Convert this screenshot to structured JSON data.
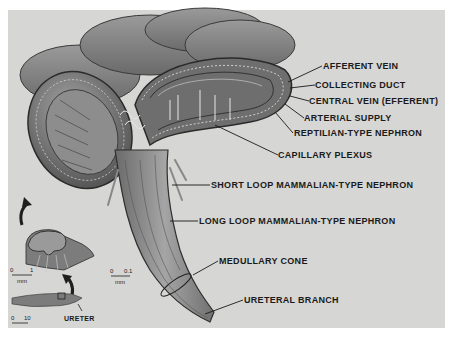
{
  "figure": {
    "labels": {
      "afferent_vein": "AFFERENT VEIN",
      "collecting_duct": "COLLECTING DUCT",
      "central_vein": "CENTRAL VEIN (EFFERENT)",
      "arterial_supply": "ARTERIAL SUPPLY",
      "reptilian_nephron": "REPTILIAN-TYPE NEPHRON",
      "capillary_plexus": "CAPILLARY PLEXUS",
      "short_loop": "SHORT LOOP MAMMALIAN-TYPE NEPHRON",
      "long_loop": "LONG LOOP MAMMALIAN-TYPE NEPHRON",
      "medullary_cone": "MEDULLARY CONE",
      "ureteral_branch": "URETERAL BRANCH",
      "ureter": "URETER"
    },
    "scale_bars": [
      {
        "id": "inset-mid",
        "start": "0",
        "end": "1",
        "unit": "mm"
      },
      {
        "id": "main",
        "start": "0",
        "end": "0.1",
        "unit": "mm"
      },
      {
        "id": "inset-bottom",
        "start": "0",
        "end": "10",
        "unit": "mm"
      }
    ],
    "colors": {
      "background": "#d6d6d4",
      "tissue_dark": "#5a5a5a",
      "tissue_mid": "#8a8a8a",
      "tissue_light": "#b0b0b0",
      "text": "#1a1a1a"
    }
  }
}
